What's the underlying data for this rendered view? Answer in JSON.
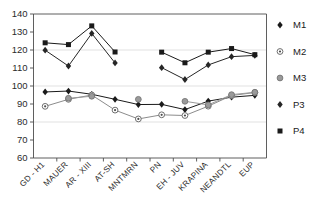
{
  "chart_data": {
    "type": "line",
    "title": "",
    "subtitle": "",
    "xlabel": "",
    "ylabel": "",
    "ylim": [
      60,
      140
    ],
    "yticks": [
      60,
      70,
      80,
      90,
      100,
      110,
      120,
      130,
      140
    ],
    "grid": true,
    "gridlines_y": [
      80,
      100,
      120
    ],
    "legend_position": "right",
    "categories": [
      "GD - H1",
      "MAUER",
      "AR - XIII",
      "AT-SH",
      "MNTMRN",
      "PN",
      "EH - JUV",
      "KRAPINA",
      "NEANDTL",
      "EUP"
    ],
    "series": [
      {
        "name": "M1",
        "marker": "filled-diamond",
        "color": "#1a1a1a",
        "values": [
          96.7,
          97.2,
          95.4,
          92.6,
          89.7,
          89.8,
          86.9,
          91.6,
          93.8,
          94.8
        ]
      },
      {
        "name": "M2",
        "marker": "ring-circle",
        "color": "#8c8c8c",
        "values": [
          88.7,
          92.6,
          95.0,
          86.6,
          81.7,
          84.0,
          83.6,
          88.8,
          94.7,
          96.4
        ]
      },
      {
        "name": "M3",
        "marker": "gray-circle",
        "color": "#9a9a9a",
        "values": [
          null,
          93.2,
          94.3,
          null,
          92.6,
          null,
          91.5,
          89.5,
          95.2,
          96.5
        ]
      },
      {
        "name": "P3",
        "marker": "filled-diamond",
        "color": "#262626",
        "values": [
          119.9,
          111.1,
          129.2,
          112.8,
          null,
          110.2,
          103.6,
          111.7,
          116.3,
          117.0
        ]
      },
      {
        "name": "P4",
        "marker": "filled-square",
        "color": "#1a1a1a",
        "values": [
          124.0,
          123.0,
          133.4,
          118.9,
          null,
          118.8,
          112.9,
          118.8,
          120.8,
          117.4
        ]
      }
    ],
    "legend": [
      {
        "label": "M1",
        "marker": "filled-diamond"
      },
      {
        "label": "M2",
        "marker": "ring-circle"
      },
      {
        "label": "M3",
        "marker": "gray-circle"
      },
      {
        "label": "P3",
        "marker": "filled-diamond"
      },
      {
        "label": "P4",
        "marker": "filled-square"
      }
    ]
  }
}
